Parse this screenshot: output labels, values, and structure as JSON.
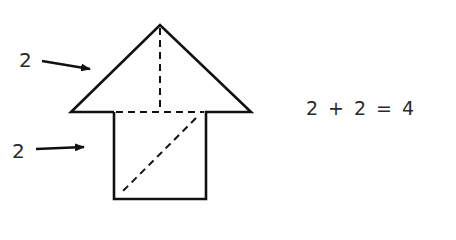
{
  "diagram": {
    "triangle": {
      "label": "2"
    },
    "square": {
      "label": "2"
    },
    "equation": {
      "term1": "2",
      "op1": "+",
      "term2": "2",
      "op2": "=",
      "result": "4"
    },
    "colors": {
      "stroke": "#111111",
      "text": "#2a2a2a",
      "background": "#ffffff"
    }
  }
}
